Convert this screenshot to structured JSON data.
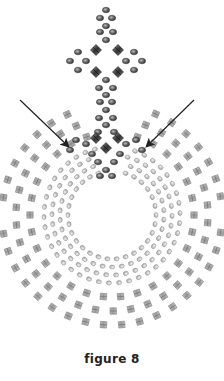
{
  "caption": "figure 8",
  "diagram": {
    "type": "beading-pattern",
    "center": [
      112,
      215
    ],
    "hole_radius": 38,
    "colors": {
      "seed_bead_light": "#b8b8b8",
      "seed_bead_dark": "#555555",
      "bicone_light": "#a9a9a9",
      "bicone_dark": "#4a4a4a",
      "arrow": "#222222"
    },
    "seed_rings": [
      {
        "r": 44,
        "n": 30
      },
      {
        "r": 52,
        "n": 34
      },
      {
        "r": 60,
        "n": 38
      },
      {
        "r": 68,
        "n": 42
      }
    ],
    "bicone_rings": [
      {
        "r": 82,
        "n": 30
      },
      {
        "r": 96,
        "n": 34
      },
      {
        "r": 110,
        "n": 38
      }
    ],
    "arrows": [
      {
        "from": [
          20,
          100
        ],
        "to": [
          68,
          146
        ]
      },
      {
        "from": [
          194,
          100
        ],
        "to": [
          147,
          146
        ]
      }
    ]
  }
}
